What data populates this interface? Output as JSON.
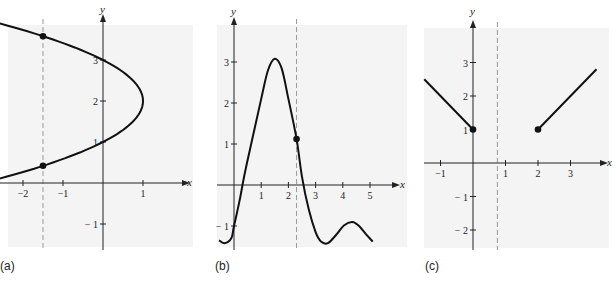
{
  "chart_data": [
    {
      "id": "a",
      "type": "line",
      "caption": "(a)",
      "title": "",
      "xlabel": "x",
      "ylabel": "y",
      "description": "Sideways parabola x = 1 - (y - 2)^2 with vertical dashed line x = -1.5 intersecting curve at two points",
      "x_ticks": [
        -2,
        -1,
        1
      ],
      "y_ticks": [
        1,
        2,
        3,
        -1
      ],
      "xlim": [
        -2.5,
        2.0
      ],
      "ylim": [
        -1.4,
        4.0
      ],
      "curve": {
        "form": "x = 1 - (y-2)^2",
        "vertex": [
          1,
          2
        ],
        "y_range": [
          -0.1,
          3.9
        ]
      },
      "dashed_line": {
        "x": -1.5
      },
      "points": [
        [
          -1.5,
          3.58
        ],
        [
          -1.5,
          0.42
        ]
      ],
      "grid": false
    },
    {
      "id": "b",
      "type": "line",
      "caption": "(b)",
      "title": "",
      "xlabel": "x",
      "ylabel": "y",
      "description": "Smooth oscillating curve with peak near (1.5, 3.1), vertical dashed line x = 2.3 meeting curve once",
      "x_ticks": [
        1,
        2,
        3,
        4,
        5
      ],
      "y_ticks": [
        3,
        2,
        1,
        -1
      ],
      "xlim": [
        -0.6,
        5.9
      ],
      "ylim": [
        -1.5,
        3.7
      ],
      "curve_points": [
        [
          -0.55,
          -1.35
        ],
        [
          -0.35,
          -1.42
        ],
        [
          -0.1,
          -1.3
        ],
        [
          0.0,
          -1.0
        ],
        [
          0.2,
          -0.4
        ],
        [
          0.4,
          0.3
        ],
        [
          0.7,
          1.2
        ],
        [
          1.0,
          2.1
        ],
        [
          1.25,
          2.8
        ],
        [
          1.5,
          3.08
        ],
        [
          1.75,
          2.85
        ],
        [
          2.0,
          2.1
        ],
        [
          2.3,
          1.12
        ],
        [
          2.5,
          0.2
        ],
        [
          2.75,
          -0.6
        ],
        [
          3.0,
          -1.15
        ],
        [
          3.2,
          -1.38
        ],
        [
          3.45,
          -1.42
        ],
        [
          3.75,
          -1.22
        ],
        [
          4.05,
          -0.98
        ],
        [
          4.35,
          -0.9
        ],
        [
          4.6,
          -1.0
        ],
        [
          4.85,
          -1.2
        ],
        [
          5.1,
          -1.38
        ]
      ],
      "dashed_line": {
        "x": 2.3
      },
      "points": [
        [
          2.3,
          1.12
        ]
      ],
      "grid": false
    },
    {
      "id": "c",
      "type": "line",
      "caption": "(c)",
      "title": "",
      "xlabel": "x",
      "ylabel": "y",
      "description": "Two line segments: one from (-1.5, 2.5) down to (0, 1), one from (2, 1) up to (3.8, 2.8); dashed vertical line near x = 0.75",
      "x_ticks": [
        -1,
        1,
        2,
        3
      ],
      "y_ticks": [
        3,
        2,
        1,
        -1,
        -2
      ],
      "xlim": [
        -1.5,
        4.2
      ],
      "ylim": [
        -2.5,
        4.0
      ],
      "segments": [
        [
          [
            -1.5,
            2.5
          ],
          [
            0,
            1
          ]
        ],
        [
          [
            2,
            1
          ],
          [
            3.8,
            2.8
          ]
        ]
      ],
      "dashed_line": {
        "x": 0.75
      },
      "points": [
        [
          0,
          1
        ],
        [
          2,
          1
        ]
      ],
      "grid": false
    }
  ],
  "captions": {
    "a": "(a)",
    "b": "(b)",
    "c": "(c)"
  },
  "colors": {
    "background_panel": "#f4f4f4",
    "curve": "#111111",
    "axis": "#222222",
    "dashed": "#999999"
  }
}
